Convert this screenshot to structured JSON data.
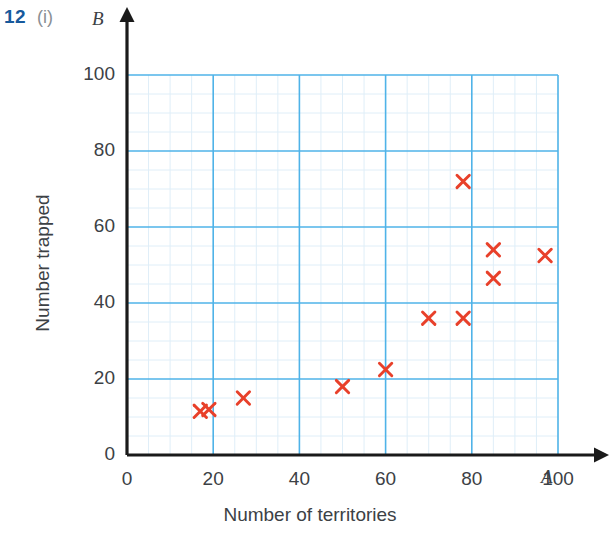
{
  "question": {
    "number": "12",
    "part": "(i)",
    "number_color": "#17599c",
    "part_color": "#8a8f94"
  },
  "chart_data": {
    "type": "scatter",
    "title": "",
    "xlabel": "Number of territories",
    "ylabel": "Number trapped",
    "x_axis_variable": "A",
    "y_axis_variable": "B",
    "xlim": [
      0,
      100
    ],
    "ylim": [
      0,
      100
    ],
    "x_ticks": [
      "0",
      "20",
      "40",
      "60",
      "80",
      "100"
    ],
    "y_ticks": [
      "0",
      "20",
      "40",
      "60",
      "80",
      "100"
    ],
    "x_tick_values": [
      0,
      20,
      40,
      60,
      80,
      100
    ],
    "y_tick_values": [
      0,
      20,
      40,
      60,
      80,
      100
    ],
    "grid": true,
    "major_grid_step": 20,
    "minor_grid_step": 5,
    "legend": false,
    "marker": "x",
    "marker_color": "#e8402a",
    "grid_major_color": "#4fb3e8",
    "grid_minor_color": "#dfeef8",
    "axis_color": "#1a1a1a",
    "points": [
      {
        "x": 17,
        "y": 11.5
      },
      {
        "x": 19,
        "y": 12
      },
      {
        "x": 27,
        "y": 15
      },
      {
        "x": 50,
        "y": 18
      },
      {
        "x": 60,
        "y": 22.5
      },
      {
        "x": 70,
        "y": 36
      },
      {
        "x": 78,
        "y": 36
      },
      {
        "x": 78,
        "y": 72
      },
      {
        "x": 85,
        "y": 46.5
      },
      {
        "x": 85,
        "y": 54
      },
      {
        "x": 97,
        "y": 52.5
      }
    ]
  }
}
